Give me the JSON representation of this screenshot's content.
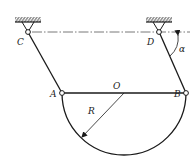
{
  "diagram": {
    "type": "mechanism",
    "labels": {
      "C": "C",
      "D": "D",
      "A": "A",
      "B": "B",
      "O": "O",
      "R": "R",
      "alpha": "α"
    },
    "colors": {
      "stroke": "#1a1a1a",
      "centerline": "#555555",
      "background": "#ffffff"
    },
    "elements": [
      "fixed-support-C",
      "fixed-support-D",
      "rod-CA",
      "rod-DB",
      "semicircular-plate-AB",
      "diameter-AB",
      "radius-R-arrow",
      "angle-alpha-arc",
      "dash-dot-centerline"
    ]
  }
}
